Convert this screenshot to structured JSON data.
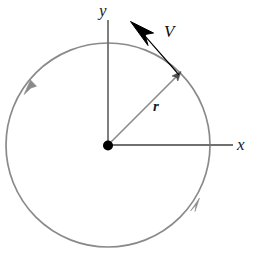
{
  "figure": {
    "type": "physics-diagram",
    "background_color": "#ffffff"
  },
  "labels": {
    "y_axis": "y",
    "x_axis": "x",
    "velocity": "V",
    "radius": "r"
  },
  "colors": {
    "circle": "#8a8a8a",
    "axis": "#707070",
    "radius_line": "#8a8a8a",
    "velocity_vector": "#000000",
    "origin_dot": "#000000",
    "text": "#1a1a1a"
  },
  "geometry": {
    "center": {
      "x": 108,
      "y": 145
    },
    "radius_px": 102,
    "particle_angle_deg": 45,
    "particle_point": {
      "x": 180,
      "y": 73
    },
    "velocity_tip": {
      "x": 131,
      "y": 22
    },
    "y_axis_top": {
      "x": 108,
      "y": 20
    },
    "x_axis_right": {
      "x": 233,
      "y": 145
    },
    "rotation_direction": "counterclockwise",
    "direction_arrow_left": {
      "x": 27,
      "y": 88
    },
    "direction_arrow_bottom_right": {
      "x": 196,
      "y": 206
    }
  }
}
